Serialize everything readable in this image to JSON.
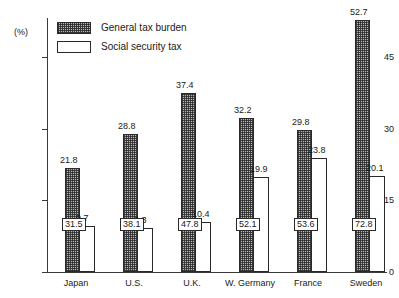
{
  "chart_data": {
    "type": "bar",
    "title": "",
    "subtitle": "",
    "xlabel": "",
    "ylabel": "(%)",
    "ylim": [
      0,
      56
    ],
    "yticks": [
      0,
      15,
      30,
      45
    ],
    "ytick_labels": [
      "0",
      "15",
      "30",
      "45"
    ],
    "grid": false,
    "legend_position": "top-left",
    "categories": [
      "Japan",
      "U.S.",
      "U.K.",
      "W. Germany",
      "France",
      "Sweden"
    ],
    "series": [
      {
        "name": "General tax burden",
        "style": "hatched",
        "values": [
          21.8,
          28.8,
          37.4,
          32.2,
          29.8,
          52.7
        ]
      },
      {
        "name": "Social security tax",
        "style": "open",
        "values": [
          9.7,
          9.3,
          10.4,
          19.9,
          23.8,
          20.1
        ]
      }
    ],
    "inbar_annotations": [
      "31.5",
      "38.1",
      "47.8",
      "52.1",
      "53.6",
      "72.8"
    ],
    "colors": {
      "axis": "#3a3a3a",
      "bar_outline": "#2a2a2a",
      "hatched_fill": "#b5b5b5",
      "open_fill": "#ffffff",
      "text": "#1a1a1a",
      "background": "#ffffff"
    }
  }
}
